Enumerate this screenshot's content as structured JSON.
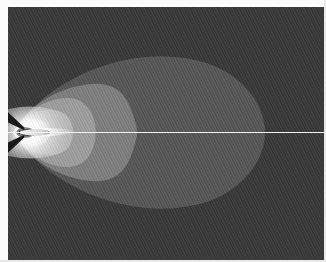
{
  "figure": {
    "kind": "grayscale-contour-field",
    "caption": ""
  },
  "canvas": {
    "width": 316,
    "height": 253,
    "offset_x": 8,
    "offset_y": 7,
    "background_color": "#3b3b3b",
    "border_color": "#2f2f2f"
  },
  "axis_line": {
    "label": "axis-of-symmetry",
    "color": "#f2f2f2",
    "y_fraction": 0.496,
    "x_start_fraction": 0.0,
    "x_end_fraction": 1.0,
    "thickness_px": 1
  },
  "nozzle": {
    "label": "nozzle-exit",
    "x_fraction": 0.02,
    "y_fraction": 0.496,
    "core_color": "#ffffff",
    "shock_color": "#1a1a1a"
  },
  "colors": {
    "background": "#3b3b3b",
    "band_1": "#4b4b4b",
    "band_2": "#585858",
    "band_3": "#6d6d6d",
    "band_4": "#7e7e7e",
    "band_5": "#8e8e8e",
    "band_6": "#9c9c9c",
    "band_7": "#adadad",
    "band_8": "#c2c2c2",
    "core_white": "#ffffff",
    "shock_dark": "#1c1c1c",
    "axis_white": "#f2f2f2",
    "page_white": "#fbfbfb"
  },
  "chart_data": {
    "type": "heatmap",
    "xlabel": "",
    "ylabel": "",
    "xlim": [
      0,
      1
    ],
    "ylim": [
      0,
      1
    ],
    "grid": false,
    "legend": "none",
    "colormap": "grayscale",
    "annotations": [
      "nozzle exit at left edge on the centerline",
      "bright supersonic core with barrel shock just downstream of the exit",
      "white horizontal axis of symmetry spanning full width",
      "nested teardrop contour bands expanding downstream"
    ],
    "contour_levels": [
      {
        "name": "outer-plume-boundary",
        "fill": "#585858",
        "level_index": 1,
        "outline": [
          [
            0.015,
            0.496
          ],
          [
            0.055,
            0.43
          ],
          [
            0.11,
            0.36
          ],
          [
            0.18,
            0.3
          ],
          [
            0.26,
            0.25
          ],
          [
            0.345,
            0.215
          ],
          [
            0.435,
            0.195
          ],
          [
            0.53,
            0.195
          ],
          [
            0.62,
            0.215
          ],
          [
            0.7,
            0.26
          ],
          [
            0.76,
            0.325
          ],
          [
            0.8,
            0.4
          ],
          [
            0.818,
            0.496
          ],
          [
            0.8,
            0.592
          ],
          [
            0.76,
            0.667
          ],
          [
            0.7,
            0.732
          ],
          [
            0.62,
            0.777
          ],
          [
            0.53,
            0.797
          ],
          [
            0.435,
            0.797
          ],
          [
            0.345,
            0.777
          ],
          [
            0.26,
            0.742
          ],
          [
            0.18,
            0.692
          ],
          [
            0.11,
            0.632
          ],
          [
            0.055,
            0.562
          ],
          [
            0.015,
            0.496
          ]
        ]
      },
      {
        "name": "mid-plume-band",
        "fill": "#7e7e7e",
        "level_index": 2,
        "outline": [
          [
            0.015,
            0.496
          ],
          [
            0.045,
            0.44
          ],
          [
            0.09,
            0.385
          ],
          [
            0.15,
            0.34
          ],
          [
            0.215,
            0.312
          ],
          [
            0.28,
            0.3
          ],
          [
            0.33,
            0.312
          ],
          [
            0.365,
            0.345
          ],
          [
            0.39,
            0.4
          ],
          [
            0.404,
            0.46
          ],
          [
            0.41,
            0.496
          ],
          [
            0.404,
            0.532
          ],
          [
            0.39,
            0.592
          ],
          [
            0.365,
            0.647
          ],
          [
            0.33,
            0.68
          ],
          [
            0.28,
            0.692
          ],
          [
            0.215,
            0.68
          ],
          [
            0.15,
            0.652
          ],
          [
            0.09,
            0.607
          ],
          [
            0.045,
            0.552
          ],
          [
            0.015,
            0.496
          ]
        ]
      },
      {
        "name": "inner-plume-band",
        "fill": "#9c9c9c",
        "level_index": 3,
        "outline": [
          [
            0.015,
            0.496
          ],
          [
            0.04,
            0.452
          ],
          [
            0.075,
            0.408
          ],
          [
            0.12,
            0.375
          ],
          [
            0.17,
            0.358
          ],
          [
            0.218,
            0.362
          ],
          [
            0.252,
            0.39
          ],
          [
            0.272,
            0.437
          ],
          [
            0.28,
            0.496
          ],
          [
            0.272,
            0.555
          ],
          [
            0.252,
            0.602
          ],
          [
            0.218,
            0.63
          ],
          [
            0.17,
            0.634
          ],
          [
            0.12,
            0.617
          ],
          [
            0.075,
            0.584
          ],
          [
            0.04,
            0.54
          ],
          [
            0.015,
            0.496
          ]
        ]
      },
      {
        "name": "core-band",
        "fill": "#b4b4b4",
        "level_index": 4,
        "outline": [
          [
            0.015,
            0.496
          ],
          [
            0.035,
            0.462
          ],
          [
            0.065,
            0.428
          ],
          [
            0.105,
            0.408
          ],
          [
            0.145,
            0.404
          ],
          [
            0.18,
            0.42
          ],
          [
            0.2,
            0.452
          ],
          [
            0.208,
            0.496
          ],
          [
            0.2,
            0.54
          ],
          [
            0.18,
            0.572
          ],
          [
            0.145,
            0.588
          ],
          [
            0.105,
            0.584
          ],
          [
            0.065,
            0.564
          ],
          [
            0.035,
            0.53
          ],
          [
            0.015,
            0.496
          ]
        ]
      },
      {
        "name": "bright-core",
        "fill": "#dadada",
        "level_index": 5,
        "outline": [
          [
            0.015,
            0.496
          ],
          [
            0.03,
            0.47
          ],
          [
            0.055,
            0.448
          ],
          [
            0.085,
            0.44
          ],
          [
            0.112,
            0.45
          ],
          [
            0.128,
            0.47
          ],
          [
            0.133,
            0.496
          ],
          [
            0.128,
            0.522
          ],
          [
            0.112,
            0.542
          ],
          [
            0.085,
            0.552
          ],
          [
            0.055,
            0.544
          ],
          [
            0.03,
            0.522
          ],
          [
            0.015,
            0.496
          ]
        ]
      }
    ]
  }
}
